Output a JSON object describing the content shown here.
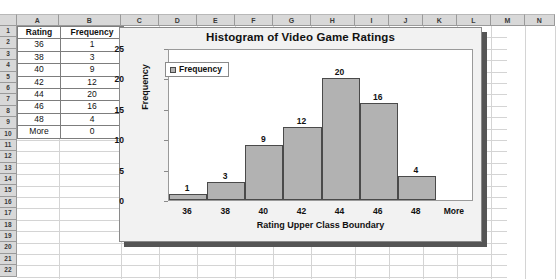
{
  "spreadsheet": {
    "column_headers": [
      "A",
      "B",
      "C",
      "D",
      "E",
      "F",
      "G",
      "H",
      "I",
      "J",
      "K",
      "L",
      "M",
      "N"
    ],
    "row_headers": [
      "1",
      "2",
      "3",
      "4",
      "5",
      "6",
      "7",
      "8",
      "9",
      "10",
      "11",
      "12",
      "13",
      "14",
      "15",
      "16",
      "17",
      "18",
      "19",
      "20",
      "21",
      "22"
    ],
    "table": {
      "headers": [
        "Rating",
        "Frequency"
      ],
      "rows": [
        [
          "36",
          "1"
        ],
        [
          "38",
          "3"
        ],
        [
          "40",
          "9"
        ],
        [
          "42",
          "12"
        ],
        [
          "44",
          "20"
        ],
        [
          "46",
          "16"
        ],
        [
          "48",
          "4"
        ],
        [
          "More",
          "0"
        ]
      ]
    }
  },
  "chart_data": {
    "type": "bar",
    "title": "Histogram of Video Game Ratings",
    "xlabel": "Rating Upper Class Boundary",
    "ylabel": "Frequency",
    "categories": [
      "36",
      "38",
      "40",
      "42",
      "44",
      "46",
      "48",
      "More"
    ],
    "values": [
      1,
      3,
      9,
      12,
      20,
      16,
      4,
      0
    ],
    "series": [
      {
        "name": "Frequency",
        "values": [
          1,
          3,
          9,
          12,
          20,
          16,
          4,
          0
        ]
      }
    ],
    "ylim": [
      0,
      25
    ],
    "yticks": [
      0,
      5,
      10,
      15,
      20,
      25
    ],
    "grid": false,
    "legend": {
      "position": "top-left",
      "entries": [
        "Frequency"
      ]
    },
    "data_labels": [
      "1",
      "3",
      "9",
      "12",
      "20",
      "16",
      "4",
      ""
    ],
    "colors": {
      "bar_fill": "#b2b2b2",
      "bar_border": "#4a4a4a",
      "plot_background": "#ffffff",
      "chart_background": "#f2f2f2"
    }
  }
}
